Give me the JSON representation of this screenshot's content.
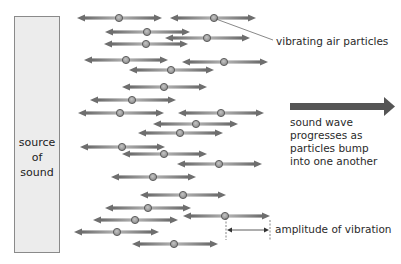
{
  "source": {
    "lines": [
      "source",
      "of",
      "sound"
    ]
  },
  "labels": {
    "particles": "vibrating air particles",
    "wave_lines": [
      "sound wave",
      "progresses as",
      "particles bump",
      "into one another"
    ],
    "amplitude": "amplitude of vibration"
  },
  "colors": {
    "arrow": "#6e6e6e",
    "arrow_light": "#a8a8a8",
    "particle_fill": "#9a9a9a",
    "particle_stroke": "#555555",
    "wave_arrow": "#555555",
    "box_fill": "#ececec",
    "box_stroke": "#8a8a8a"
  },
  "arrows": [
    {
      "y": 18,
      "x1": 77,
      "x2": 162,
      "p": 119
    },
    {
      "y": 18,
      "x1": 170,
      "x2": 256,
      "p": 214
    },
    {
      "y": 32,
      "x1": 105,
      "x2": 190,
      "p": 147
    },
    {
      "y": 38,
      "x1": 165,
      "x2": 250,
      "p": 207
    },
    {
      "y": 44,
      "x1": 104,
      "x2": 188,
      "p": 146
    },
    {
      "y": 60,
      "x1": 84,
      "x2": 168,
      "p": 126
    },
    {
      "y": 62,
      "x1": 182,
      "x2": 268,
      "p": 224
    },
    {
      "y": 70,
      "x1": 129,
      "x2": 214,
      "p": 171
    },
    {
      "y": 87,
      "x1": 122,
      "x2": 207,
      "p": 164
    },
    {
      "y": 100,
      "x1": 90,
      "x2": 176,
      "p": 132
    },
    {
      "y": 113,
      "x1": 78,
      "x2": 164,
      "p": 120
    },
    {
      "y": 113,
      "x1": 178,
      "x2": 264,
      "p": 221
    },
    {
      "y": 124,
      "x1": 153,
      "x2": 238,
      "p": 196
    },
    {
      "y": 133,
      "x1": 138,
      "x2": 223,
      "p": 180
    },
    {
      "y": 147,
      "x1": 80,
      "x2": 165,
      "p": 122
    },
    {
      "y": 154,
      "x1": 122,
      "x2": 207,
      "p": 164
    },
    {
      "y": 164,
      "x1": 177,
      "x2": 262,
      "p": 219
    },
    {
      "y": 177,
      "x1": 111,
      "x2": 196,
      "p": 153
    },
    {
      "y": 195,
      "x1": 140,
      "x2": 226,
      "p": 183
    },
    {
      "y": 208,
      "x1": 105,
      "x2": 191,
      "p": 148
    },
    {
      "y": 216,
      "x1": 183,
      "x2": 270,
      "p": 225
    },
    {
      "y": 220,
      "x1": 93,
      "x2": 178,
      "p": 135
    },
    {
      "y": 232,
      "x1": 74,
      "x2": 159,
      "p": 117
    },
    {
      "y": 244,
      "x1": 132,
      "x2": 218,
      "p": 174
    }
  ]
}
